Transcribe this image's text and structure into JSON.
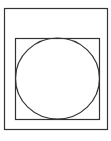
{
  "diagram": {
    "stroke_color": "#333333",
    "background": "#ffffff",
    "outer_rect": {
      "x": 4.5,
      "y": 8.5,
      "width": 103,
      "height": 121
    },
    "inner_rect": {
      "x": 15.5,
      "y": 38.5,
      "width": 84,
      "height": 81
    },
    "circle": {
      "cx": 57.5,
      "cy": 78.5,
      "rx": 42,
      "ry": 40.5
    }
  }
}
